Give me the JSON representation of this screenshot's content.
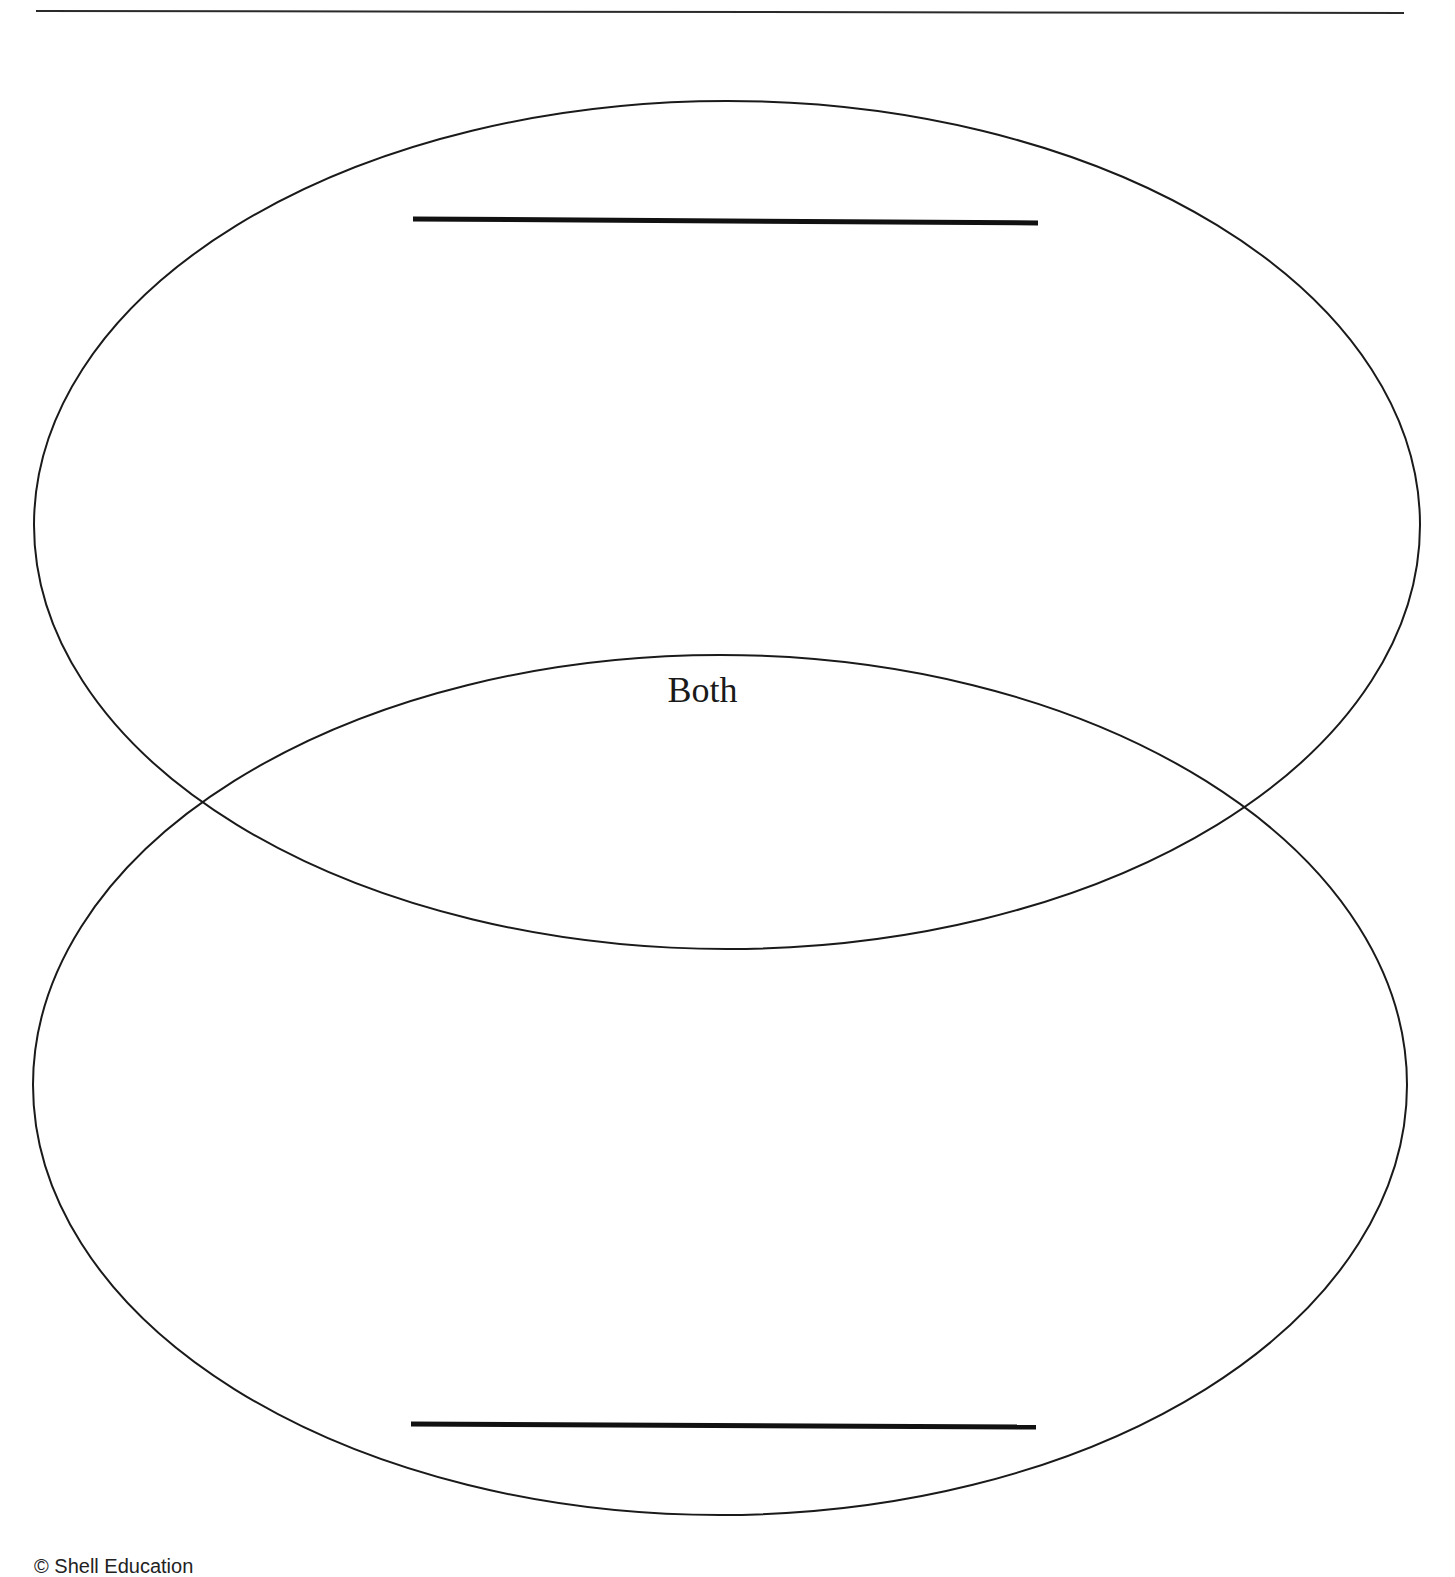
{
  "diagram": {
    "type": "venn-two-ellipse-vertical",
    "stroke_color": "#1a1a1a",
    "background": "#ffffff",
    "top_rule": {
      "x1": 36,
      "y1": 11,
      "x2": 1404,
      "y2": 13,
      "width": 2
    },
    "upper_ellipse": {
      "cx": 727,
      "cy": 525,
      "rx": 693,
      "ry": 424
    },
    "lower_ellipse": {
      "cx": 720,
      "cy": 1085,
      "rx": 687,
      "ry": 430
    },
    "upper_title_line": {
      "x1": 413,
      "y1": 219,
      "x2": 1038,
      "y2": 223,
      "width": 5
    },
    "lower_title_line": {
      "x1": 411,
      "y1": 1424,
      "x2": 1036,
      "y2": 1427,
      "width": 5
    },
    "overlap_label": "Both"
  },
  "footer": {
    "text": "© Shell Education"
  }
}
